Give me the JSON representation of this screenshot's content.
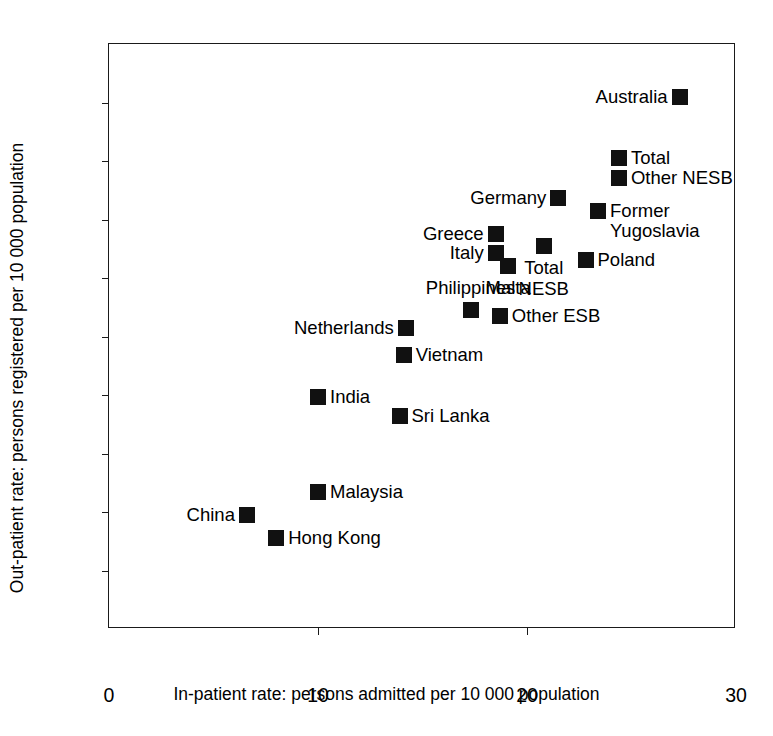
{
  "chart_data": {
    "type": "scatter",
    "title": "",
    "xlabel": "In-patient rate: persons admitted per 10 000 population",
    "ylabel": "Out-patient rate: persons registered per 10 000 population",
    "xlim": [
      0,
      30
    ],
    "ylim": [
      0,
      100
    ],
    "xticks": [
      0,
      10,
      20,
      30
    ],
    "yticks": [
      0,
      10,
      20,
      30,
      40,
      50,
      60,
      70,
      80,
      90,
      100
    ],
    "xtick_labels": [
      "0",
      "10",
      "20",
      "30"
    ],
    "ytick_labels": [
      "0",
      "10",
      "20",
      "30",
      "40",
      "50",
      "60",
      "70",
      "80",
      "90",
      "100"
    ],
    "grid": false,
    "legend": false,
    "marker": "filled-square",
    "marker_color": "#111111",
    "points": [
      {
        "label": "Australia",
        "x": 27.3,
        "y": 91.0,
        "label_pos": "left"
      },
      {
        "label": "Total",
        "x": 24.4,
        "y": 80.5,
        "label_pos": "right"
      },
      {
        "label": "Other NESB",
        "x": 24.4,
        "y": 77.1,
        "label_pos": "right"
      },
      {
        "label": "Former\nYugoslavia",
        "x": 23.4,
        "y": 71.5,
        "label_pos": "right"
      },
      {
        "label": "Germany",
        "x": 21.5,
        "y": 73.7,
        "label_pos": "left"
      },
      {
        "label": "Greece",
        "x": 18.5,
        "y": 67.6,
        "label_pos": "left"
      },
      {
        "label": "Italy",
        "x": 18.5,
        "y": 64.3,
        "label_pos": "left"
      },
      {
        "label": "Malta",
        "x": 19.1,
        "y": 62.1,
        "label_pos": "below"
      },
      {
        "label": "Total\nNESB",
        "x": 20.8,
        "y": 65.5,
        "label_pos": "below"
      },
      {
        "label": "Poland",
        "x": 22.8,
        "y": 63.1,
        "label_pos": "right"
      },
      {
        "label": "Philippines",
        "x": 17.3,
        "y": 54.5,
        "label_pos": "above"
      },
      {
        "label": "Other ESB",
        "x": 18.7,
        "y": 53.5,
        "label_pos": "right"
      },
      {
        "label": "Netherlands",
        "x": 14.2,
        "y": 51.4,
        "label_pos": "left"
      },
      {
        "label": "Vietnam",
        "x": 14.1,
        "y": 46.9,
        "label_pos": "right"
      },
      {
        "label": "India",
        "x": 10.0,
        "y": 39.7,
        "label_pos": "right"
      },
      {
        "label": "Sri Lanka",
        "x": 13.9,
        "y": 36.4,
        "label_pos": "right"
      },
      {
        "label": "Malaysia",
        "x": 10.0,
        "y": 23.4,
        "label_pos": "right"
      },
      {
        "label": "China",
        "x": 6.6,
        "y": 19.5,
        "label_pos": "left"
      },
      {
        "label": "Hong Kong",
        "x": 8.0,
        "y": 15.6,
        "label_pos": "right"
      }
    ]
  }
}
